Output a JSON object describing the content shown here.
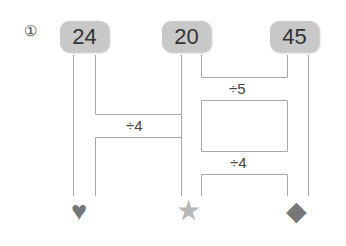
{
  "problem_label": "①",
  "top_numbers": [
    {
      "id": "a",
      "value": "24"
    },
    {
      "id": "b",
      "value": "20"
    },
    {
      "id": "c",
      "value": "45"
    }
  ],
  "operations": [
    {
      "id": "op1",
      "label": "÷5"
    },
    {
      "id": "op2",
      "label": "÷4"
    },
    {
      "id": "op3",
      "label": "÷4"
    }
  ],
  "bottom_symbols": [
    {
      "id": "heart",
      "glyph": "♥",
      "color": "#777777"
    },
    {
      "id": "star",
      "glyph": "★",
      "color": "#b8b8b8"
    },
    {
      "id": "diamond",
      "glyph": "◆",
      "color": "#777777"
    }
  ]
}
